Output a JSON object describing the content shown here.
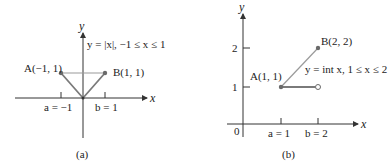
{
  "panels": [
    {
      "id": "a",
      "caption": "(a)",
      "x_axis_label": "x",
      "y_axis_label": "y",
      "function_label": "y = |x|, −1 ≤ x ≤ 1",
      "point_A_label": "A(−1, 1)",
      "point_B_label": "B(1, 1)",
      "tick_a_label": "a = −1",
      "tick_b_label": "b = 1",
      "graph": {
        "type": "abs",
        "domain": [
          -1,
          1
        ]
      },
      "points": {
        "A": [
          -1,
          1
        ],
        "B": [
          1,
          1
        ]
      }
    },
    {
      "id": "b",
      "caption": "(b)",
      "x_axis_label": "x",
      "y_axis_label": "y",
      "origin_label": "0",
      "function_label": "y = int x, 1 ≤ x ≤ 2",
      "point_A_label": "A(1, 1)",
      "point_B_label": "B(2, 2)",
      "tick_a_label": "a = 1",
      "tick_b_label": "b = 2",
      "y_tick_labels": [
        "1",
        "2"
      ],
      "graph": {
        "type": "floor",
        "domain": [
          1,
          2
        ]
      },
      "points": {
        "A": [
          1,
          1
        ],
        "B": [
          2,
          2
        ],
        "open": [
          2,
          1
        ]
      }
    }
  ],
  "colors": {
    "axis": "#333333",
    "graph": "#7a7a7a",
    "chord": "#9a9a9a",
    "point": "#6a6a6a"
  }
}
